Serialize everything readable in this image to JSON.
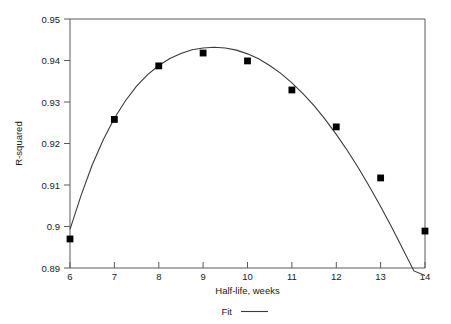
{
  "chart_data": {
    "type": "scatter",
    "title": "",
    "subtitle": "",
    "xlabel": "Half-life, weeks",
    "ylabel": "R-squared",
    "xlim": [
      6,
      14
    ],
    "ylim": [
      0.89,
      0.95
    ],
    "xticks": [
      6,
      7,
      8,
      9,
      10,
      11,
      12,
      13,
      14
    ],
    "xtick_labels": [
      "6",
      "7",
      "8",
      "9",
      "10",
      "11",
      "12",
      "13",
      "14"
    ],
    "yticks": [
      0.89,
      0.9,
      0.91,
      0.92,
      0.93,
      0.94,
      0.95
    ],
    "ytick_labels": [
      "0.89",
      "0.9",
      "0.91",
      "0.92",
      "0.93",
      "0.94",
      "0.95"
    ],
    "grid": false,
    "legend_position": "below-axis-center",
    "x": [
      6,
      7,
      8,
      9,
      10,
      11,
      12,
      13,
      14
    ],
    "series": [
      {
        "name": "Observed",
        "marker": "filled-square",
        "color": "#000000",
        "values": [
          0.897,
          0.9258,
          0.9387,
          0.9418,
          0.9399,
          0.9329,
          0.924,
          0.9117,
          0.8989
        ]
      },
      {
        "name": "Fit",
        "marker": "none",
        "line": "solid",
        "color": "#3a3a3a",
        "x": [
          6,
          6.25,
          6.5,
          6.75,
          7,
          7.25,
          7.5,
          7.75,
          8,
          8.25,
          8.5,
          8.75,
          9,
          9.25,
          9.5,
          9.75,
          10,
          10.25,
          10.5,
          10.75,
          11,
          11.25,
          11.5,
          11.75,
          12,
          12.25,
          12.5,
          12.75,
          13,
          13.25,
          13.5,
          13.75,
          14
        ],
        "values": [
          0.8993,
          0.9075,
          0.9148,
          0.9209,
          0.9261,
          0.9303,
          0.9338,
          0.9366,
          0.9388,
          0.9405,
          0.9417,
          0.9426,
          0.943,
          0.9432,
          0.943,
          0.9425,
          0.9416,
          0.9404,
          0.9388,
          0.9369,
          0.9346,
          0.932,
          0.9291,
          0.9258,
          0.9222,
          0.9183,
          0.9141,
          0.9096,
          0.9048,
          0.8998,
          0.8946,
          0.8893,
          0.8882
        ]
      }
    ],
    "legend": [
      {
        "label": "Fit",
        "swatch": "line",
        "color": "#3a3a3a"
      }
    ],
    "annotations": []
  },
  "axes": {
    "x_title": "Half-life, weeks",
    "y_title": "R-squared"
  },
  "legend_entry": {
    "fit_label": "Fit"
  }
}
